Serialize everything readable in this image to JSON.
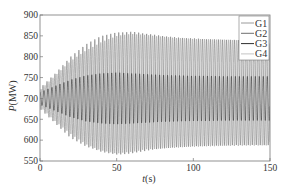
{
  "chart_data": {
    "type": "line",
    "title": "",
    "xlabel": "t(s)",
    "xlabel_italic": "t",
    "xlabel_unit": "(s)",
    "ylabel": "P(MW)",
    "ylabel_italic": "P",
    "ylabel_unit": "(MW)",
    "xlim": [
      0,
      150
    ],
    "ylim": [
      550,
      900
    ],
    "x_ticks": [
      0,
      50,
      100,
      150
    ],
    "y_ticks": [
      550,
      600,
      650,
      700,
      750,
      800,
      850,
      900
    ],
    "grid": false,
    "legend_position": "upper right",
    "oscillation_period_s": 2.6,
    "series": [
      {
        "name": "G1",
        "color": "#9a9a9a",
        "baseline": 700,
        "envelope": {
          "t": [
            0,
            10,
            20,
            30,
            40,
            50,
            60,
            70,
            80,
            90,
            100,
            110,
            120,
            130,
            140,
            150
          ],
          "upper": [
            720,
            755,
            790,
            815,
            835,
            850,
            855,
            852,
            848,
            845,
            843,
            842,
            841,
            840,
            840,
            840
          ],
          "lower": [
            680,
            645,
            615,
            590,
            575,
            568,
            572,
            578,
            580,
            582,
            584,
            585,
            586,
            586,
            587,
            587
          ]
        }
      },
      {
        "name": "G2",
        "color": "#6e6e6e",
        "baseline": 700,
        "envelope": {
          "t": [
            0,
            10,
            20,
            30,
            40,
            50,
            60,
            70,
            80,
            90,
            100,
            110,
            120,
            130,
            140,
            150
          ],
          "upper": [
            725,
            760,
            800,
            830,
            850,
            858,
            860,
            855,
            850,
            846,
            844,
            842,
            841,
            840,
            840,
            840
          ],
          "lower": [
            675,
            640,
            605,
            585,
            572,
            565,
            568,
            575,
            580,
            583,
            585,
            586,
            587,
            588,
            588,
            588
          ]
        }
      },
      {
        "name": "G3",
        "color": "#2e2e2e",
        "baseline": 700,
        "envelope": {
          "t": [
            0,
            10,
            20,
            30,
            40,
            50,
            60,
            70,
            80,
            90,
            100,
            110,
            120,
            130,
            140,
            150
          ],
          "upper": [
            715,
            730,
            745,
            755,
            760,
            762,
            760,
            758,
            756,
            755,
            754,
            754,
            753,
            753,
            753,
            753
          ],
          "lower": [
            685,
            670,
            655,
            645,
            640,
            638,
            640,
            642,
            644,
            645,
            646,
            646,
            647,
            647,
            647,
            647
          ]
        }
      },
      {
        "name": "G4",
        "color": "#c4c4c4",
        "baseline": 700,
        "envelope": {
          "t": [
            0,
            10,
            20,
            30,
            40,
            50,
            60,
            70,
            80,
            90,
            100,
            110,
            120,
            130,
            140,
            150
          ],
          "upper": [
            712,
            735,
            760,
            780,
            792,
            800,
            798,
            795,
            792,
            790,
            789,
            788,
            788,
            787,
            787,
            787
          ],
          "lower": [
            688,
            665,
            640,
            620,
            608,
            600,
            602,
            605,
            608,
            610,
            611,
            612,
            612,
            613,
            613,
            613
          ]
        }
      }
    ]
  }
}
